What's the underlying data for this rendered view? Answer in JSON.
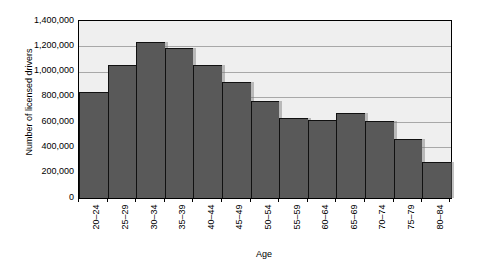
{
  "chart_data": {
    "type": "bar",
    "title": "",
    "xlabel": "Age",
    "ylabel": "Number of licensed drivers",
    "categories": [
      "20–24",
      "25–29",
      "30–34",
      "35–39",
      "40–44",
      "45–49",
      "50–54",
      "55–59",
      "60–64",
      "65–69",
      "70–74",
      "75–79",
      "80–84"
    ],
    "values": [
      835000,
      1055000,
      1235000,
      1190000,
      1050000,
      915000,
      765000,
      630000,
      620000,
      675000,
      610000,
      465000,
      285000
    ],
    "ylim": [
      0,
      1400000
    ],
    "ytick_values": [
      0,
      200000,
      400000,
      600000,
      800000,
      1000000,
      1200000,
      1400000
    ],
    "ytick_labels": [
      "0",
      "200,000",
      "400,000",
      "600,000",
      "800,000",
      "1,000,000",
      "1,200,000",
      "1,400,000"
    ],
    "grid": true,
    "grid_axis": "y",
    "legend": null,
    "bar_color": "#595959",
    "plot_background": "#efefef",
    "grid_color": "#a8a8a8",
    "axis_color": "#000000"
  }
}
